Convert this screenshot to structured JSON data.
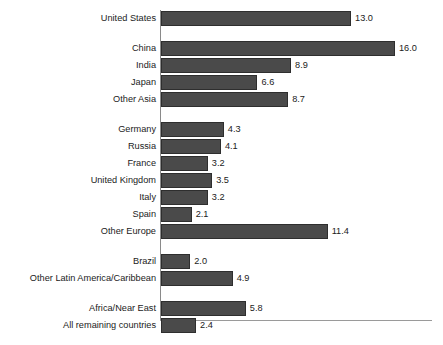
{
  "chart_data": {
    "type": "bar",
    "orientation": "horizontal",
    "title": "",
    "subtitle": "",
    "xlabel": "",
    "ylabel": "",
    "grid": false,
    "legend": null,
    "xlim": [
      0,
      18.6
    ],
    "categories": [
      "United States",
      "China",
      "India",
      "Japan",
      "Other Asia",
      "Germany",
      "Russia",
      "France",
      "United Kingdom",
      "Italy",
      "Spain",
      "Other Europe",
      "Brazil",
      "Other Latin America/Caribbean",
      "Africa/Near East",
      "All remaining countries"
    ],
    "values": [
      13.0,
      16.0,
      8.9,
      6.6,
      8.7,
      4.3,
      4.1,
      3.2,
      3.5,
      3.2,
      2.1,
      11.4,
      2.0,
      4.9,
      5.8,
      2.4
    ],
    "value_labels": [
      "13.0",
      "16.0",
      "8.9",
      "6.6",
      "8.7",
      "4.3",
      "4.1",
      "3.2",
      "3.5",
      "3.2",
      "2.1",
      "11.4",
      "2.0",
      "4.9",
      "5.8",
      "2.4"
    ],
    "groups": [
      {
        "name": "",
        "indices": [
          0
        ]
      },
      {
        "name": "",
        "indices": [
          1,
          2,
          3,
          4
        ]
      },
      {
        "name": "",
        "indices": [
          5,
          6,
          7,
          8,
          9,
          10,
          11
        ]
      },
      {
        "name": "",
        "indices": [
          12,
          13
        ]
      },
      {
        "name": "",
        "indices": [
          14,
          15
        ]
      }
    ],
    "colors": {
      "bar_fill": "#4a4a4a",
      "bar_outline": "#2e2e2e",
      "axis": "#8a8a8a",
      "text": "#1b1b1b",
      "background": "#ffffff"
    }
  }
}
